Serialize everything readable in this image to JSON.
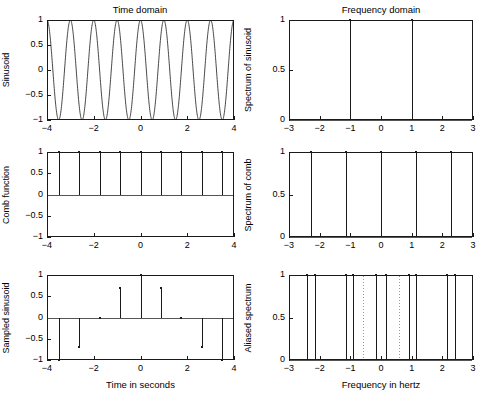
{
  "figure": {
    "column_titles": {
      "left": "Time domain",
      "right": "Frequency domain"
    },
    "xlabels": {
      "left": "Time in seconds",
      "right": "Frequency in hertz"
    }
  },
  "chart_data": [
    {
      "type": "line",
      "panel": "top-left",
      "title": "Time domain",
      "ylabel": "Sinusoid",
      "xlabel": "",
      "xlim": [
        -4,
        4
      ],
      "ylim": [
        -1,
        1
      ],
      "xticks": [
        -4,
        -2,
        0,
        2,
        4
      ],
      "xticklabels": [
        "-4",
        "-2",
        "0",
        "2",
        "4"
      ],
      "yticks": [
        -1,
        -0.5,
        0,
        0.5,
        1
      ],
      "yticklabels": [
        "-1",
        "-0.5",
        "0",
        "0.5",
        "1"
      ],
      "grid": false,
      "legend": null,
      "series": [
        {
          "name": "cos(2*pi*1*t)",
          "frequency_hz": 1,
          "amplitude": 1,
          "phase": 0
        }
      ]
    },
    {
      "type": "scatter",
      "panel": "top-right",
      "title": "Frequency domain",
      "ylabel": "Spectrum of sinusoid",
      "xlabel": "",
      "xlim": [
        -3,
        3
      ],
      "ylim": [
        0,
        1
      ],
      "xticks": [
        -3,
        -2,
        -1,
        0,
        1,
        2,
        3
      ],
      "xticklabels": [
        "-3",
        "-2",
        "-1",
        "0",
        "1",
        "2",
        "3"
      ],
      "yticks": [
        0,
        0.5,
        1
      ],
      "yticklabels": [
        "0",
        "0.5",
        "1"
      ],
      "grid": false,
      "legend": null,
      "x": [
        -1,
        1
      ],
      "values": [
        1,
        1
      ]
    },
    {
      "type": "scatter",
      "panel": "middle-left",
      "title": "",
      "ylabel": "Comb function",
      "xlabel": "",
      "xlim": [
        -4,
        4
      ],
      "ylim": [
        -1,
        1
      ],
      "xticks": [
        -4,
        -2,
        0,
        2,
        4
      ],
      "xticklabels": [
        "-4",
        "-2",
        "0",
        "2",
        "4"
      ],
      "yticks": [
        -1,
        -0.5,
        0,
        0.5,
        1
      ],
      "yticklabels": [
        "-1",
        "-0.5",
        "0",
        "0.5",
        "1"
      ],
      "grid": false,
      "legend": null,
      "sample_period_s": 0.875,
      "x": [
        -3.5,
        -2.625,
        -1.75,
        -0.875,
        0,
        0.875,
        1.75,
        2.625,
        3.5
      ],
      "values": [
        1,
        1,
        1,
        1,
        1,
        1,
        1,
        1,
        1
      ]
    },
    {
      "type": "scatter",
      "panel": "middle-right",
      "title": "",
      "ylabel": "Spectrum of comb",
      "xlabel": "",
      "xlim": [
        -3,
        3
      ],
      "ylim": [
        0,
        1
      ],
      "xticks": [
        -3,
        -2,
        -1,
        0,
        1,
        2,
        3
      ],
      "xticklabels": [
        "-3",
        "-2",
        "-1",
        "0",
        "1",
        "2",
        "3"
      ],
      "yticks": [
        0,
        0.5,
        1
      ],
      "yticklabels": [
        "0",
        "0.5",
        "1"
      ],
      "grid": false,
      "legend": null,
      "sampling_rate_hz": 1.1428,
      "x": [
        -2.2857,
        -1.1428,
        0,
        1.1428,
        2.2857
      ],
      "values": [
        1,
        1,
        1,
        1,
        1
      ]
    },
    {
      "type": "scatter",
      "panel": "bottom-left",
      "title": "",
      "ylabel": "Sampled sinusoid",
      "xlabel": "Time in seconds",
      "xlim": [
        -4,
        4
      ],
      "ylim": [
        -1,
        1
      ],
      "xticks": [
        -4,
        -2,
        0,
        2,
        4
      ],
      "xticklabels": [
        "-4",
        "-2",
        "0",
        "2",
        "4"
      ],
      "yticks": [
        -1,
        -0.5,
        0,
        0.5,
        1
      ],
      "yticklabels": [
        "-1",
        "-0.5",
        "0",
        "0.5",
        "1"
      ],
      "grid": false,
      "legend": null,
      "x": [
        -3.5,
        -2.625,
        -1.75,
        -0.875,
        0,
        0.875,
        1.75,
        2.625,
        3.5
      ],
      "values": [
        -1,
        -0.7,
        0,
        0.7,
        1,
        0.7,
        0,
        -0.7,
        -1
      ]
    },
    {
      "type": "scatter",
      "panel": "bottom-right",
      "title": "",
      "ylabel": "Aliased spectrum",
      "xlabel": "Frequency in hertz",
      "xlim": [
        -3,
        3
      ],
      "ylim": [
        0,
        1
      ],
      "xticks": [
        -3,
        -2,
        -1,
        0,
        1,
        2,
        3
      ],
      "xticklabels": [
        "-3",
        "-2",
        "-1",
        "0",
        "1",
        "2",
        "3"
      ],
      "yticks": [
        0,
        0.5,
        1
      ],
      "yticklabels": [
        "0",
        "0.5",
        "1"
      ],
      "grid": false,
      "legend": null,
      "nyquist_lines": [
        -0.5714,
        0.5714
      ],
      "x": [
        -2.4,
        -2.15,
        -1.15,
        -0.9,
        -0.15,
        0.15,
        0.9,
        1.15,
        2.15,
        2.4
      ],
      "values": [
        1,
        1,
        1,
        1,
        1,
        1,
        1,
        1,
        1,
        1
      ]
    }
  ]
}
